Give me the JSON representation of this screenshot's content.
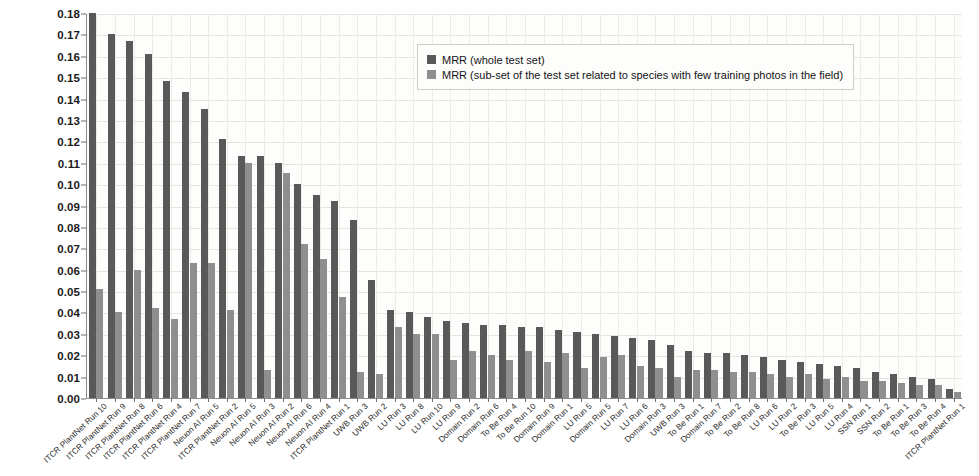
{
  "chart_data": {
    "type": "bar",
    "title": "",
    "subtitle": "",
    "xlabel": "",
    "ylabel": "",
    "ylim": [
      0.0,
      0.18
    ],
    "grid": true,
    "legend_position": "top-center",
    "y_ticks": [
      "0.00",
      "0.01",
      "0.02",
      "0.03",
      "0.04",
      "0.05",
      "0.06",
      "0.07",
      "0.08",
      "0.09",
      "0.10",
      "0.11",
      "0.12",
      "0.13",
      "0.14",
      "0.15",
      "0.16",
      "0.17",
      "0.18"
    ],
    "y_tick_values": [
      0.0,
      0.01,
      0.02,
      0.03,
      0.04,
      0.05,
      0.06,
      0.07,
      0.08,
      0.09,
      0.1,
      0.11,
      0.12,
      0.13,
      0.14,
      0.15,
      0.16,
      0.17,
      0.18
    ],
    "categories": [
      "ITCR PlantNet Run 10",
      "ITCR PlantNet Run 9",
      "ITCR PlantNet Run 8",
      "ITCR PlantNet Run 6",
      "ITCR PlantNet Run 4",
      "ITCR PlantNet Run 7",
      "Neuon AI Run 5",
      "ITCR PlantNet Run 2",
      "Neuon AI Run 5",
      "Neuon AI Run 3",
      "Neuon AI Run 2",
      "Neuon AI Run 6",
      "Neuon AI Run 4",
      "ITCR PlantNet Run 1",
      "UWB Run 3",
      "UWB Run 2",
      "LU Run 3",
      "LU Run 8",
      "LU Run 10",
      "LU Run 9",
      "Domain Run 2",
      "Domain Run 6",
      "To Be Run 4",
      "To Be Run 10",
      "Domain Run 9",
      "Domain Run 1",
      "LU Run 5",
      "Domain Run 5",
      "LU Run 7",
      "LU Run 6",
      "Domain Run 3",
      "UWB Run 3",
      "To Be Run 1",
      "Domain Run 7",
      "To Be Run 2",
      "To Be Run 8",
      "LU Run 6",
      "LU Run 2",
      "To Be Run 3",
      "LU Run 5",
      "LU Run 4",
      "SSN Run 1",
      "SSN Run 2",
      "To Be Run 1",
      "To Be Run 3",
      "To Be Run 4",
      "ITCR PlantNet Run 1"
    ],
    "series": [
      {
        "name": "MRR (whole test set)",
        "color": "#595959",
        "values": [
          0.18,
          0.17,
          0.167,
          0.161,
          0.148,
          0.143,
          0.135,
          0.121,
          0.113,
          0.113,
          0.11,
          0.1,
          0.095,
          0.092,
          0.083,
          0.055,
          0.041,
          0.04,
          0.038,
          0.036,
          0.035,
          0.034,
          0.034,
          0.033,
          0.033,
          0.032,
          0.031,
          0.03,
          0.029,
          0.028,
          0.027,
          0.025,
          0.022,
          0.021,
          0.021,
          0.02,
          0.019,
          0.018,
          0.017,
          0.016,
          0.015,
          0.014,
          0.012,
          0.011,
          0.01,
          0.009,
          0.004
        ]
      },
      {
        "name": "MRR (sub-set of the test set related to species with few training photos in the field)",
        "color": "#8f8f8f",
        "values": [
          0.051,
          0.04,
          0.06,
          0.042,
          0.037,
          0.063,
          0.063,
          0.041,
          0.11,
          0.013,
          0.105,
          0.072,
          0.065,
          0.047,
          0.012,
          0.011,
          0.033,
          0.03,
          0.03,
          0.018,
          0.022,
          0.02,
          0.018,
          0.022,
          0.017,
          0.021,
          0.014,
          0.019,
          0.02,
          0.015,
          0.014,
          0.01,
          0.013,
          0.013,
          0.012,
          0.012,
          0.011,
          0.01,
          0.011,
          0.009,
          0.01,
          0.008,
          0.008,
          0.007,
          0.006,
          0.006,
          0.003
        ]
      }
    ]
  },
  "legend": {
    "entries": [
      {
        "label": "MRR (whole test set)",
        "color": "#595959"
      },
      {
        "label": "MRR (sub-set of the test set related to species with few training photos in the field)",
        "color": "#8f8f8f"
      }
    ]
  }
}
